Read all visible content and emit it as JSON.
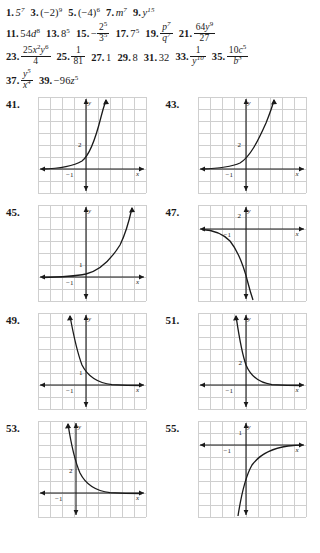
{
  "page": {
    "type": "textbook-answer-key",
    "sections": [
      "odd-answers",
      "graph-answers"
    ]
  },
  "answers": {
    "lines": [
      {
        "id": "line-1",
        "items": [
          {
            "num": "1.",
            "expr": "5⁷",
            "base": "5",
            "exp": "7"
          },
          {
            "num": "3.",
            "expr": "(−2)⁹",
            "base": "(−2)",
            "exp": "9"
          },
          {
            "num": "5.",
            "expr": "(−4)⁶",
            "base": "(−4)",
            "exp": "6"
          },
          {
            "num": "7.",
            "expr": "m⁷",
            "base": "m",
            "exp": "7"
          },
          {
            "num": "9.",
            "expr": "y¹⁵",
            "base": "y",
            "exp": "15"
          }
        ]
      },
      {
        "id": "line-2",
        "items": [
          {
            "num": "11.",
            "expr": "54d⁸"
          },
          {
            "num": "13.",
            "expr": "8⁵"
          },
          {
            "num": "15.",
            "expr": "−2⁵/3⁵",
            "numerator": "2⁵",
            "denominator": "3⁵",
            "sign": "−"
          },
          {
            "num": "17.",
            "expr": "7⁵"
          },
          {
            "num": "19.",
            "expr": "p⁷/q⁷",
            "numerator": "p⁷",
            "denominator": "q⁷"
          },
          {
            "num": "21.",
            "expr": "64y⁹/27",
            "numerator": "64y⁹",
            "denominator": "27"
          }
        ]
      },
      {
        "id": "line-3",
        "items": [
          {
            "num": "23.",
            "expr": "25x²y⁶/4",
            "numerator": "25x²y⁶",
            "denominator": "4"
          },
          {
            "num": "25.",
            "expr": "1/81",
            "numerator": "1",
            "denominator": "81"
          },
          {
            "num": "27.",
            "expr": "1"
          },
          {
            "num": "29.",
            "expr": "8"
          },
          {
            "num": "31.",
            "expr": "32"
          },
          {
            "num": "33.",
            "expr": "1/y¹⁰",
            "numerator": "1",
            "denominator": "y¹⁰"
          },
          {
            "num": "35.",
            "expr": "10c⁵/b³",
            "numerator": "10c⁵",
            "denominator": "b³"
          }
        ]
      },
      {
        "id": "line-4",
        "items": [
          {
            "num": "37.",
            "expr": "y⁵/x⁴",
            "numerator": "y⁵",
            "denominator": "x⁴"
          },
          {
            "num": "39.",
            "expr": "−96z⁵"
          }
        ]
      }
    ]
  },
  "graphs": [
    {
      "number": "41.",
      "axis_x_label": "x",
      "axis_y_label": "y",
      "y_intercept_label": "2",
      "x_tick_label": "−1",
      "shape": "exponential-growth",
      "description": "increasing exponential curve, horizontal asymptote y=0, passes through (0,2)"
    },
    {
      "number": "43.",
      "axis_x_label": "x",
      "axis_y_label": "y",
      "y_intercept_label": "2",
      "x_tick_label": "−1",
      "shape": "exponential-growth",
      "description": "increasing exponential curve, horizontal asymptote y=0, passes through (0,2)"
    },
    {
      "number": "45.",
      "axis_x_label": "x",
      "axis_y_label": "y",
      "y_intercept_label": "1",
      "x_tick_label": "−1",
      "shape": "exponential-growth",
      "description": "increasing exponential curve, horizontal asymptote y=0, passes through (0,1)"
    },
    {
      "number": "47.",
      "axis_x_label": "x",
      "axis_y_label": "y",
      "y_intercept_label": "2",
      "x_tick_label": "−1",
      "shape": "reflected-exponential-decreasing",
      "description": "decreasing curve below x-axis, asymptote y=0 from below, falls steeply to the right"
    },
    {
      "number": "49.",
      "axis_x_label": "x",
      "axis_y_label": "y",
      "y_intercept_label": "1",
      "x_tick_label": "−1",
      "shape": "exponential-decay",
      "description": "decreasing exponential curve, horizontal asymptote y=0, passes through (0,1)"
    },
    {
      "number": "51.",
      "axis_x_label": "x",
      "axis_y_label": "y",
      "y_intercept_label": "2",
      "x_tick_label": "−1",
      "shape": "exponential-decay",
      "description": "steep decreasing exponential curve, horizontal asymptote y=0, passes through (0,2)"
    },
    {
      "number": "53.",
      "axis_x_label": "x",
      "axis_y_label": "y",
      "y_intercept_label": "2",
      "x_tick_label": "−1",
      "shape": "exponential-decay",
      "description": "decreasing exponential curve, horizontal asymptote y=0, passes through (0,2)"
    },
    {
      "number": "55.",
      "axis_x_label": "x",
      "axis_y_label": "y",
      "y_intercept_label": "1",
      "x_tick_label": "−1",
      "shape": "reflected-exponential-increasing",
      "description": "increasing curve below x-axis rising toward asymptote y=0 from below"
    }
  ],
  "chart_data": [
    {
      "type": "line",
      "title": "41.",
      "xlabel": "x",
      "ylabel": "y",
      "xlim": [
        -5,
        4
      ],
      "ylim": [
        -2,
        5
      ],
      "grid": true,
      "series": [
        {
          "name": "f(x)",
          "y_intercept": 2,
          "behavior": "growth",
          "asymptote": 0
        }
      ]
    },
    {
      "type": "line",
      "title": "43.",
      "xlabel": "x",
      "ylabel": "y",
      "xlim": [
        -5,
        4
      ],
      "ylim": [
        -2,
        5
      ],
      "grid": true,
      "series": [
        {
          "name": "f(x)",
          "y_intercept": 2,
          "behavior": "growth",
          "asymptote": 0
        }
      ]
    },
    {
      "type": "line",
      "title": "45.",
      "xlabel": "x",
      "ylabel": "y",
      "xlim": [
        -5,
        4
      ],
      "ylim": [
        -2,
        5
      ],
      "grid": true,
      "series": [
        {
          "name": "f(x)",
          "y_intercept": 1,
          "behavior": "growth",
          "asymptote": 0
        }
      ]
    },
    {
      "type": "line",
      "title": "47.",
      "xlabel": "x",
      "ylabel": "y",
      "xlim": [
        -5,
        4
      ],
      "ylim": [
        -6,
        2
      ],
      "grid": true,
      "series": [
        {
          "name": "f(x)",
          "y_intercept": -0.5,
          "behavior": "reflected-growth",
          "asymptote": 0
        }
      ]
    },
    {
      "type": "line",
      "title": "49.",
      "xlabel": "x",
      "ylabel": "y",
      "xlim": [
        -4,
        5
      ],
      "ylim": [
        -2,
        5
      ],
      "grid": true,
      "series": [
        {
          "name": "f(x)",
          "y_intercept": 1,
          "behavior": "decay",
          "asymptote": 0
        }
      ]
    },
    {
      "type": "line",
      "title": "51.",
      "xlabel": "x",
      "ylabel": "y",
      "xlim": [
        -4,
        5
      ],
      "ylim": [
        -2,
        5
      ],
      "grid": true,
      "series": [
        {
          "name": "f(x)",
          "y_intercept": 2,
          "behavior": "decay",
          "asymptote": 0
        }
      ]
    },
    {
      "type": "line",
      "title": "53.",
      "xlabel": "x",
      "ylabel": "y",
      "xlim": [
        -4,
        5
      ],
      "ylim": [
        -2,
        5
      ],
      "grid": true,
      "series": [
        {
          "name": "f(x)",
          "y_intercept": 2,
          "behavior": "decay",
          "asymptote": 0
        }
      ]
    },
    {
      "type": "line",
      "title": "55.",
      "xlabel": "x",
      "ylabel": "y",
      "xlim": [
        -4,
        5
      ],
      "ylim": [
        -6,
        2
      ],
      "grid": true,
      "series": [
        {
          "name": "f(x)",
          "y_intercept": -1,
          "behavior": "reflected-decay",
          "asymptote": 0
        }
      ]
    }
  ],
  "colors": {
    "grid": "#cfcfcf",
    "axis": "#1a1a1a",
    "curve": "#1a1a1a",
    "background": "#ffffff"
  }
}
